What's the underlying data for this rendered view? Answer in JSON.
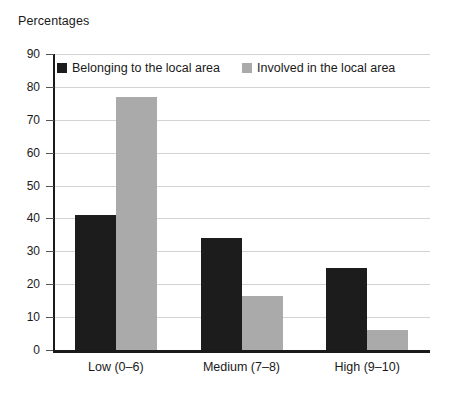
{
  "chart_data": {
    "type": "bar",
    "title": "Percentages",
    "xlabel": "",
    "ylabel": "",
    "ylim": [
      0,
      90
    ],
    "ytick_step": 10,
    "yticks": [
      90,
      80,
      70,
      60,
      50,
      40,
      30,
      20,
      10,
      0
    ],
    "grid": true,
    "legend_position": "top-left-inside",
    "categories": [
      "Low (0–6)",
      "Medium (7–8)",
      "High (9–10)"
    ],
    "series": [
      {
        "name": "Belonging to the local area",
        "color": "#1c1c1c",
        "values": [
          41,
          34,
          25
        ]
      },
      {
        "name": "Involved in the local area",
        "color": "#aaaaaa",
        "values": [
          77,
          16.5,
          6
        ]
      }
    ]
  },
  "colors": {
    "series_dark": "#1c1c1c",
    "series_grey": "#aaaaaa",
    "gridline": "#d3d3d3",
    "axis": "#1a1a1a",
    "background": "#ffffff"
  }
}
